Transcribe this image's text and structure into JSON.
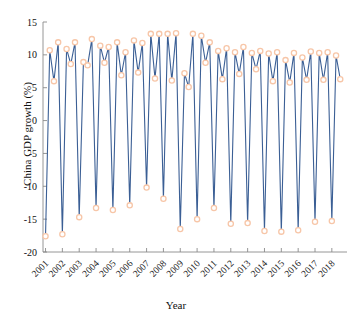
{
  "chart_data": {
    "type": "line",
    "title": "",
    "xlabel": "Year",
    "ylabel": "China GDP growth (%)",
    "xlim": [
      2000.85,
      2018.9
    ],
    "ylim": [
      -20,
      15
    ],
    "grid": false,
    "legend": null,
    "marker": "circle-open",
    "line_color": "#3b5f95",
    "marker_color": "#f7c6a8",
    "yticks": [
      -20,
      -15,
      -10,
      -5,
      0,
      5,
      10,
      15
    ],
    "ytick_labels": [
      "-20",
      "-15",
      "-10",
      "-5",
      "0",
      "5",
      "10",
      "15"
    ],
    "xticks": [
      2001,
      2002,
      2003,
      2004,
      2005,
      2006,
      2007,
      2008,
      2009,
      2010,
      2011,
      2012,
      2013,
      2014,
      2015,
      2016,
      2017,
      2018
    ],
    "xtick_labels": [
      "2001",
      "2002",
      "2003",
      "2004",
      "2005",
      "2006",
      "2007",
      "2008",
      "2009",
      "2010",
      "2011",
      "2012",
      "2013",
      "2014",
      "2015",
      "2016",
      "2017",
      "2018"
    ],
    "x": [
      2001.0,
      2001.25,
      2001.5,
      2001.75,
      2002.0,
      2002.25,
      2002.5,
      2002.75,
      2003.0,
      2003.25,
      2003.5,
      2003.75,
      2004.0,
      2004.25,
      2004.5,
      2004.75,
      2005.0,
      2005.25,
      2005.5,
      2005.75,
      2006.0,
      2006.25,
      2006.5,
      2006.75,
      2007.0,
      2007.25,
      2007.5,
      2007.75,
      2008.0,
      2008.25,
      2008.5,
      2008.75,
      2009.0,
      2009.25,
      2009.5,
      2009.75,
      2010.0,
      2010.25,
      2010.5,
      2010.75,
      2011.0,
      2011.25,
      2011.5,
      2011.75,
      2012.0,
      2012.25,
      2012.5,
      2012.75,
      2013.0,
      2013.25,
      2013.5,
      2013.75,
      2014.0,
      2014.25,
      2014.5,
      2014.75,
      2015.0,
      2015.25,
      2015.5,
      2015.75,
      2016.0,
      2016.25,
      2016.5,
      2016.75,
      2017.0,
      2017.25,
      2017.5,
      2017.75,
      2018.0,
      2018.25,
      2018.5
    ],
    "values": [
      -17.6,
      10.7,
      6.0,
      11.9,
      -17.3,
      10.9,
      8.6,
      11.9,
      -14.7,
      8.9,
      8.4,
      12.4,
      -13.3,
      11.4,
      8.8,
      11.2,
      -13.6,
      11.9,
      6.9,
      10.4,
      -12.9,
      12.2,
      7.3,
      11.8,
      -10.2,
      13.2,
      6.4,
      13.2,
      -11.9,
      13.2,
      6.1,
      13.3,
      -16.5,
      7.2,
      5.1,
      13.2,
      -15.0,
      12.9,
      8.8,
      11.9,
      -13.3,
      10.6,
      6.3,
      11.0,
      -15.7,
      10.4,
      7.1,
      11.2,
      -15.6,
      10.3,
      7.8,
      10.6,
      -16.8,
      10.2,
      6.0,
      10.4,
      -16.9,
      9.2,
      5.8,
      10.3,
      -16.7,
      9.6,
      6.2,
      10.5,
      -15.4,
      10.3,
      6.2,
      10.4,
      -15.3,
      9.9,
      6.3
    ]
  },
  "axis": {
    "ylabel_text": "China GDP growth (%)",
    "xlabel_text": "Year"
  }
}
